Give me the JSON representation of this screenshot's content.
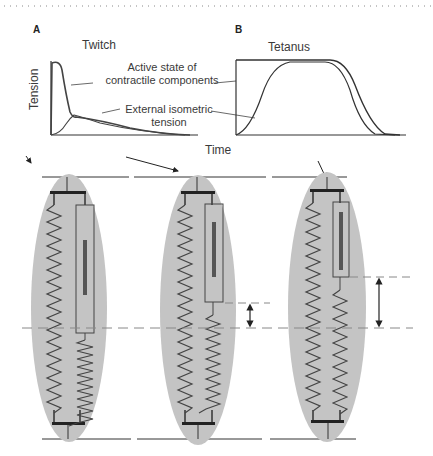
{
  "panels": [
    {
      "letter": "A",
      "title": "Twitch"
    },
    {
      "letter": "B",
      "title": "Tetanus"
    }
  ],
  "axes": {
    "ylabel": "Tension",
    "xlabel": "Time"
  },
  "annotations": {
    "active_state_line1": "Active state of",
    "active_state_line2": "contractile components",
    "external_line1": "External isometric",
    "external_line2": "tension"
  },
  "diagram": {
    "models": [
      {
        "name": "resting",
        "series_spring_extension": "none"
      },
      {
        "name": "twitch",
        "series_spring_extension": "small"
      },
      {
        "name": "tetanus",
        "series_spring_extension": "large"
      }
    ],
    "colors": {
      "ellipse_fill": "#c4c4c4",
      "line": "#333333",
      "filament": "#555555",
      "dashed": "#888888"
    }
  }
}
